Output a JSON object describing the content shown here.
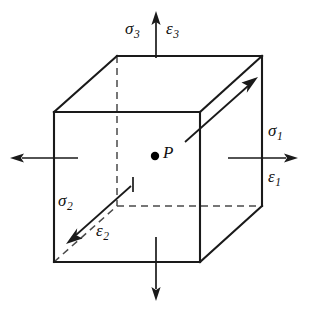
{
  "figure": {
    "name": "principal-stress-strain-cube-element",
    "background_color": "#ffffff",
    "line_color": "#1a1a1a",
    "hidden_line_color": "#4a4a4a",
    "width": 309,
    "height": 315
  },
  "labels": {
    "point": "P",
    "sigma_1": {
      "symbol": "σ",
      "subscript": "1"
    },
    "sigma_2": {
      "symbol": "σ",
      "subscript": "2"
    },
    "sigma_3": {
      "symbol": "σ",
      "subscript": "3"
    },
    "epsilon_1": {
      "symbol": "ε",
      "subscript": "1"
    },
    "epsilon_2": {
      "symbol": "ε",
      "subscript": "2"
    },
    "epsilon_3": {
      "symbol": "ε",
      "subscript": "3"
    }
  },
  "axes": [
    {
      "id": "axis-1",
      "stress": "σ₁",
      "strain": "ε₁",
      "direction": "horizontal-right",
      "arrows": [
        "right",
        "left"
      ]
    },
    {
      "id": "axis-2",
      "stress": "σ₂",
      "strain": "ε₂",
      "direction": "diagonal-depth",
      "arrows": [
        "down-left",
        "up-right"
      ]
    },
    {
      "id": "axis-3",
      "stress": "σ₃",
      "strain": "ε₃",
      "direction": "vertical",
      "arrows": [
        "up",
        "down"
      ]
    }
  ],
  "geometry": {
    "front_face": {
      "left": 54,
      "top": 112,
      "right": 200,
      "bottom": 262
    },
    "back_offset": {
      "dx": 62,
      "dy": -56
    },
    "center_point": {
      "x": 155,
      "y": 156
    }
  }
}
